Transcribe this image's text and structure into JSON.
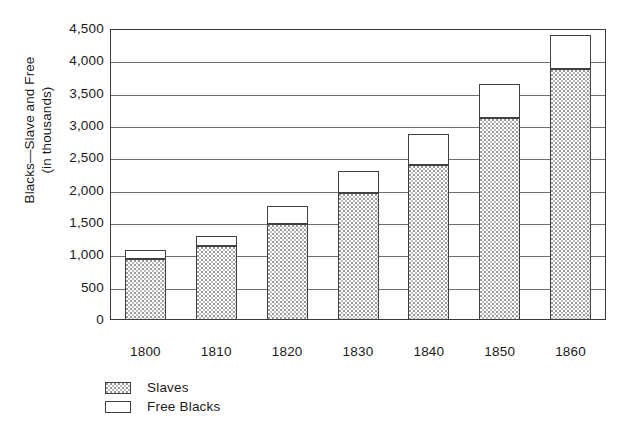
{
  "chart_data": {
    "type": "bar",
    "title": "",
    "subtitle": "",
    "stacked": true,
    "xlabel": "",
    "ylabel_line1": "Blacks—Slave and Free",
    "ylabel_line2": "(in thousands)",
    "categories": [
      "1800",
      "1810",
      "1820",
      "1830",
      "1840",
      "1850",
      "1860"
    ],
    "series": [
      {
        "name": "Slaves",
        "swatch": "stippled-gray",
        "values": [
          945,
          1150,
          1485,
          1965,
          2390,
          3120,
          3885
        ]
      },
      {
        "name": "Free Blacks",
        "swatch": "white",
        "values": [
          120,
          130,
          265,
          325,
          465,
          510,
          500
        ]
      }
    ],
    "totals": [
      1065,
      1280,
      1750,
      2290,
      2855,
      3630,
      4385
    ],
    "ylim": [
      0,
      4500
    ],
    "ytick_values": [
      0,
      500,
      1000,
      1500,
      2000,
      2500,
      3000,
      3500,
      4000,
      4500
    ],
    "ytick_labels": [
      "0",
      "500",
      "1,000",
      "1,500",
      "2,000",
      "2,500",
      "3,000",
      "3,500",
      "4,000",
      "4,500"
    ],
    "grid": true,
    "grid_axis": "y",
    "legend_position": "bottom-left",
    "legend_entries": [
      "Slaves",
      "Free Blacks"
    ],
    "colors": {
      "axis": "#3a3a3a",
      "gridline": "#6e6e6e",
      "bar_outline": "#404040",
      "slaves_fill": "#d8d8d8",
      "free_blacks_fill": "#ffffff",
      "background": "#ffffff",
      "text": "#1a1a1a"
    }
  }
}
